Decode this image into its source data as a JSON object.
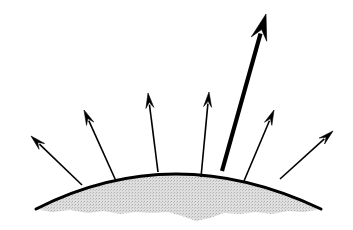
{
  "figure": {
    "width": 353,
    "height": 230,
    "background_color": "#ffffff",
    "ink_color": "#000000",
    "fill_color": "#d9d9d9",
    "stipple_color": "#b5b5b5"
  },
  "chart_data": {
    "type": "diagram",
    "xlabel": "",
    "ylabel": "",
    "xlim": [
      0,
      353
    ],
    "ylim": [
      230,
      0
    ],
    "grid": false,
    "legend": "none",
    "annotations": [],
    "dome": {
      "name": "dome-surface",
      "description": "Thick black arc with light gray stippled fill below and a ragged lower boundary",
      "arc_left": [
        36,
        209
      ],
      "arc_apex": [
        176,
        174
      ],
      "arc_right": [
        321,
        209
      ],
      "arc_stroke_width": 3.0,
      "fill": "#d9d9d9",
      "ragged_bottom_points": [
        [
          36,
          209
        ],
        [
          52,
          212
        ],
        [
          70,
          210
        ],
        [
          88,
          213
        ],
        [
          104,
          211
        ],
        [
          120,
          214
        ],
        [
          136,
          212
        ],
        [
          152,
          213
        ],
        [
          168,
          212
        ],
        [
          182,
          216
        ],
        [
          196,
          221
        ],
        [
          210,
          218
        ],
        [
          224,
          213
        ],
        [
          240,
          214
        ],
        [
          256,
          212
        ],
        [
          272,
          214
        ],
        [
          288,
          211
        ],
        [
          304,
          212
        ],
        [
          321,
          209
        ]
      ]
    },
    "arrows": [
      {
        "name": "arrow-1-far-left",
        "index": 1,
        "tail": [
          82,
          185
        ],
        "tip": [
          31,
          136
        ],
        "angle_deg": 136,
        "length": 71,
        "stroke_width": 1.6,
        "weight": "thin",
        "head_length": 15,
        "head_width": 8
      },
      {
        "name": "arrow-2-left",
        "index": 2,
        "tail": [
          116,
          181
        ],
        "tip": [
          84,
          110
        ],
        "angle_deg": 114,
        "length": 78,
        "stroke_width": 1.6,
        "weight": "thin",
        "head_length": 15,
        "head_width": 8
      },
      {
        "name": "arrow-3-left-center",
        "index": 3,
        "tail": [
          158,
          172
        ],
        "tip": [
          148,
          93
        ],
        "angle_deg": 97,
        "length": 80,
        "stroke_width": 1.6,
        "weight": "thin",
        "head_length": 15,
        "head_width": 8
      },
      {
        "name": "arrow-4-center",
        "index": 4,
        "tail": [
          201,
          177
        ],
        "tip": [
          209,
          92
        ],
        "angle_deg": 85,
        "length": 85,
        "stroke_width": 1.6,
        "weight": "thin",
        "head_length": 15,
        "head_width": 8
      },
      {
        "name": "arrow-5-bold-main",
        "index": 5,
        "tail": [
          222,
          171
        ],
        "tip": [
          266,
          14
        ],
        "angle_deg": 74,
        "length": 163,
        "stroke_width": 4.2,
        "weight": "bold",
        "head_length": 26,
        "head_width": 16
      },
      {
        "name": "arrow-6-right",
        "index": 6,
        "tail": [
          244,
          181
        ],
        "tip": [
          274,
          110
        ],
        "angle_deg": 67,
        "length": 77,
        "stroke_width": 1.6,
        "weight": "thin",
        "head_length": 15,
        "head_width": 8
      },
      {
        "name": "arrow-7-far-right",
        "index": 7,
        "tail": [
          280,
          179
        ],
        "tip": [
          333,
          131
        ],
        "angle_deg": 42,
        "length": 71,
        "stroke_width": 1.6,
        "weight": "thin",
        "head_length": 15,
        "head_width": 8
      }
    ]
  }
}
